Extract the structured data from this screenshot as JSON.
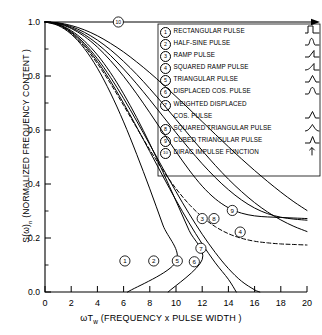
{
  "figure": {
    "type": "line-chart",
    "style": "monochrome scientific line art"
  },
  "axes": {
    "y_label": "S(ω)n (NORMALIZED FREQUENCY CONTENT )",
    "y_label_main": "S(ω)",
    "y_label_sub": "n",
    "y_label_rest": " (NORMALIZED FREQUENCY CONTENT )",
    "x_label_main": "ωT",
    "x_label_sub": "w",
    "x_label_rest": " (FREQUENCY x PULSE WIDTH )",
    "x_label": "ωTw (FREQUENCY x PULSE WIDTH )",
    "y_ticks": [
      "0.0",
      "0.2",
      "0.4",
      "0.6",
      "0.8",
      "1.0"
    ],
    "y_tick_values": [
      0.0,
      0.2,
      0.4,
      0.6,
      0.8,
      1.0
    ],
    "x_ticks": [
      "0",
      "2",
      "4",
      "6",
      "8",
      "10",
      "12",
      "14",
      "16",
      "18",
      "20"
    ],
    "x_tick_values": [
      0,
      2,
      4,
      6,
      8,
      10,
      12,
      14,
      16,
      18,
      20
    ],
    "xlim": [
      0,
      20
    ],
    "ylim": [
      0.0,
      1.0
    ],
    "grid": false
  },
  "legend": {
    "position": "top-right-inside",
    "items": [
      {
        "num": "1",
        "label": "RECTANGULAR PULSE",
        "icon": "rectangular-pulse-icon"
      },
      {
        "num": "2",
        "label": "HALF-SINE PULSE",
        "icon": "half-sine-pulse-icon"
      },
      {
        "num": "3",
        "label": "RAMP PULSE",
        "icon": "ramp-pulse-icon"
      },
      {
        "num": "4",
        "label": "SQUARED RAMP PULSE",
        "icon": "squared-ramp-pulse-icon"
      },
      {
        "num": "5",
        "label": "TRIANGULAR PULSE",
        "icon": "triangular-pulse-icon"
      },
      {
        "num": "6",
        "label": "DISPLACED COS. PULSE",
        "icon": "displaced-cos-pulse-icon"
      },
      {
        "num": "7",
        "label": "WEIGHTED  DISPLACED",
        "label2": "COS. PULSE",
        "icon": "weighted-displaced-cos-pulse-icon"
      },
      {
        "num": "8",
        "label": "SQUARED TRIANGULAR PULSE",
        "icon": "squared-triangular-pulse-icon"
      },
      {
        "num": "9",
        "label": "CUBED  TRIANGULAR  PULSE",
        "icon": "cubed-triangular-pulse-icon"
      },
      {
        "num": "10",
        "label": "DIRAC IMPULSE FUNCTION",
        "icon": "dirac-impulse-icon"
      }
    ]
  },
  "chart_data": {
    "type": "line",
    "title": "",
    "xlabel": "ωTw (FREQUENCY x PULSE WIDTH )",
    "ylabel": "S(ω)n (NORMALIZED FREQUENCY CONTENT )",
    "xlim": [
      0,
      20
    ],
    "ylim": [
      0.0,
      1.0
    ],
    "grid": false,
    "x": [
      0,
      1,
      2,
      3,
      4,
      5,
      6,
      7,
      8,
      9,
      10,
      11,
      12,
      13,
      14,
      15,
      16,
      17,
      18,
      19,
      20
    ],
    "series": [
      {
        "name": "RECTANGULAR PULSE",
        "num": "1",
        "dash": false,
        "label_at": {
          "x": 6.1,
          "y": 0.115
        },
        "values": [
          1.0,
          0.987,
          0.955,
          0.902,
          0.829,
          0.737,
          0.63,
          0.51,
          0.382,
          0.248,
          0.112,
          0.0,
          0.0,
          0.0,
          0.0,
          0.0,
          0.0,
          0.0,
          0.0,
          0.0,
          0.0
        ],
        "zero_crossing": 6.3
      },
      {
        "name": "HALF-SINE PULSE",
        "num": "2",
        "dash": false,
        "label_at": {
          "x": 8.3,
          "y": 0.115
        },
        "values": [
          1.0,
          0.992,
          0.968,
          0.93,
          0.878,
          0.812,
          0.734,
          0.646,
          0.549,
          0.445,
          0.337,
          0.228,
          0.12,
          0.0,
          0.0,
          0.0,
          0.0,
          0.0,
          0.0,
          0.0,
          0.0
        ],
        "zero_crossing": 9.4
      },
      {
        "name": "RAMP PULSE",
        "num": "3",
        "dash": false,
        "label_at": {
          "x": 12.0,
          "y": 0.272
        },
        "values": [
          1.0,
          0.994,
          0.976,
          0.947,
          0.907,
          0.857,
          0.799,
          0.734,
          0.664,
          0.592,
          0.52,
          0.452,
          0.392,
          0.345,
          0.312,
          0.292,
          0.282,
          0.278,
          0.276,
          0.274,
          0.272
        ]
      },
      {
        "name": "SQUARED RAMP PULSE",
        "num": "4",
        "dash": false,
        "label_at": {
          "x": 14.9,
          "y": 0.222
        },
        "values": [
          1.0,
          0.996,
          0.983,
          0.962,
          0.933,
          0.897,
          0.854,
          0.806,
          0.753,
          0.697,
          0.639,
          0.581,
          0.524,
          0.469,
          0.418,
          0.372,
          0.331,
          0.296,
          0.267,
          0.243,
          0.224
        ]
      },
      {
        "name": "TRIANGULAR PULSE",
        "num": "5",
        "dash": false,
        "label_at": {
          "x": 10.1,
          "y": 0.115
        },
        "values": [
          1.0,
          0.99,
          0.961,
          0.915,
          0.854,
          0.781,
          0.699,
          0.611,
          0.52,
          0.429,
          0.34,
          0.256,
          0.178,
          0.108,
          0.047,
          0.0,
          0.0,
          0.0,
          0.0,
          0.0,
          0.0
        ],
        "zero_crossing": 14.6
      },
      {
        "name": "DISPLACED COS. PULSE",
        "num": "6",
        "dash": false,
        "label_at": {
          "x": 11.4,
          "y": 0.112
        },
        "values": [
          1.0,
          0.991,
          0.964,
          0.921,
          0.864,
          0.795,
          0.717,
          0.633,
          0.546,
          0.458,
          0.372,
          0.29,
          0.214,
          0.146,
          0.087,
          0.04,
          0.008,
          0.0,
          0.0,
          0.0,
          0.0
        ],
        "zero_crossing": 16.4
      },
      {
        "name": "WEIGHTED DISPLACED COS. PULSE",
        "num": "7",
        "dash": true,
        "label_at": {
          "x": 11.9,
          "y": 0.162
        },
        "values": [
          1.0,
          0.989,
          0.958,
          0.909,
          0.846,
          0.772,
          0.691,
          0.608,
          0.527,
          0.451,
          0.383,
          0.325,
          0.278,
          0.242,
          0.216,
          0.199,
          0.188,
          0.182,
          0.178,
          0.176,
          0.174
        ]
      },
      {
        "name": "SQUARED TRIANGULAR PULSE",
        "num": "8",
        "dash": false,
        "label_at": {
          "x": 12.9,
          "y": 0.272
        },
        "values": [
          1.0,
          0.995,
          0.979,
          0.954,
          0.919,
          0.876,
          0.826,
          0.771,
          0.712,
          0.651,
          0.59,
          0.531,
          0.475,
          0.424,
          0.379,
          0.341,
          0.311,
          0.29,
          0.277,
          0.27,
          0.266
        ]
      },
      {
        "name": "CUBED TRIANGULAR PULSE",
        "num": "9",
        "dash": false,
        "label_at": {
          "x": 14.3,
          "y": 0.302
        },
        "values": [
          1.0,
          0.997,
          0.987,
          0.971,
          0.949,
          0.921,
          0.889,
          0.852,
          0.812,
          0.769,
          0.724,
          0.678,
          0.631,
          0.584,
          0.538,
          0.493,
          0.45,
          0.409,
          0.37,
          0.334,
          0.302
        ]
      },
      {
        "name": "DIRAC IMPULSE FUNCTION",
        "num": "10",
        "dash": false,
        "flat": true,
        "label_at": {
          "x": 5.6,
          "y": 1.0
        },
        "values": [
          1.0,
          1.0,
          1.0,
          1.0,
          1.0,
          1.0,
          1.0,
          1.0,
          1.0,
          1.0,
          1.0,
          1.0,
          1.0,
          1.0,
          1.0,
          1.0,
          1.0,
          1.0,
          1.0,
          1.0,
          1.0
        ]
      }
    ]
  }
}
